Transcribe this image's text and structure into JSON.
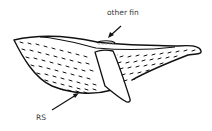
{
  "diagram": {
    "labels": {
      "other_fin": "other fin",
      "rs": "RS"
    },
    "colors": {
      "stroke": "#111111",
      "label_text": "#3a3a3a",
      "dashed_hidden_line": "#999999",
      "background": "#ffffff"
    }
  }
}
